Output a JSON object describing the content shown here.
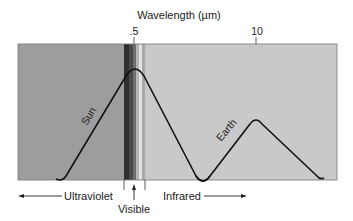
{
  "diagram": {
    "title": "Wavelength (µm)",
    "tick_labels": [
      ".5",
      "10"
    ],
    "curves": [
      {
        "label": "Sun",
        "description": "Solar emission spectrum peaking near 0.5 µm (visible)"
      },
      {
        "label": "Earth",
        "description": "Terrestrial emission spectrum peaking near 10 µm (infrared)"
      }
    ],
    "regions": {
      "left": "Ultraviolet",
      "middle": "Visible",
      "right": "Infrared"
    },
    "colors": {
      "uv_region": "#9c9c9c",
      "ir_region": "#c8c8c8",
      "visible_dark": "#3a3a3a",
      "visible_mid": "#6a6a6a",
      "visible_light": "#d8d8d8",
      "curve": "#111111"
    }
  }
}
